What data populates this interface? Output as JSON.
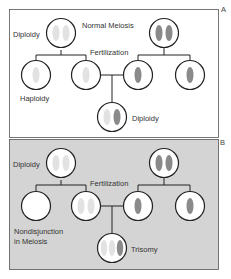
{
  "figure": {
    "panels": [
      {
        "id": "A",
        "corner_label": "A",
        "title": "Normal Meiosis",
        "labels": {
          "parent_left": "Diploidy",
          "fertilization": "Fertilization",
          "gamete": "Haploidy",
          "offspring": "Diploidy"
        }
      },
      {
        "id": "B",
        "corner_label": "B",
        "labels": {
          "parent_left": "Diploidy",
          "fertilization": "Fertilization",
          "gamete_line1": "Nondisjunction",
          "gamete_line2": "in Meiosis",
          "offspring": "Trisomy"
        }
      }
    ],
    "colors": {
      "light_chromosome": "#e2e2e2",
      "dark_chromosome": "#8a8a8a",
      "panel_b_background": "#d4d4d4",
      "line": "#222222"
    }
  }
}
